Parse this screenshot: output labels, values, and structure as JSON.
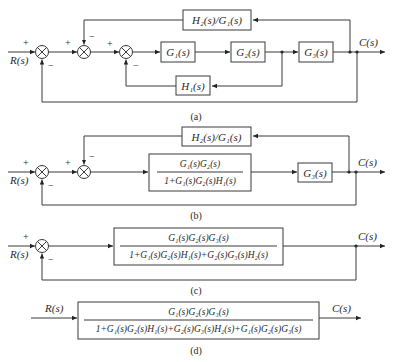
{
  "diagram": {
    "input_label": "R(s)",
    "output_label": "C(s)",
    "plus": "+",
    "minus": "−",
    "a": {
      "caption": "(a)",
      "blocks": {
        "g1": "G₁(s)",
        "g2": "G₂(s)",
        "g3": "G₃(s)",
        "h1": "H₁(s)",
        "h2_over_g1": "H₂(s)/G₁(s)"
      }
    },
    "b": {
      "caption": "(b)",
      "blocks": {
        "inner_num": "G₁(s)G₂(s)",
        "inner_den": "1+G₁(s)G₂(s)H₁(s)",
        "g3": "G₃(s)",
        "h2_over_g1": "H₂(s)/G₁(s)"
      }
    },
    "c": {
      "caption": "(c)",
      "blocks": {
        "num": "G₁(s)G₂(s)G₃(s)",
        "den": "1+G₁(s)G₂(s)H₁(s)+G₂(s)G₃(s)H₂(s)"
      }
    },
    "d": {
      "caption": "(d)",
      "blocks": {
        "num": "G₁(s)G₂(s)G₃(s)",
        "den": "1+G₁(s)G₂(s)H₁(s)+G₂(s)G₃(s)H₂(s)+G₁(s)G₂(s)G₃(s)"
      }
    }
  }
}
